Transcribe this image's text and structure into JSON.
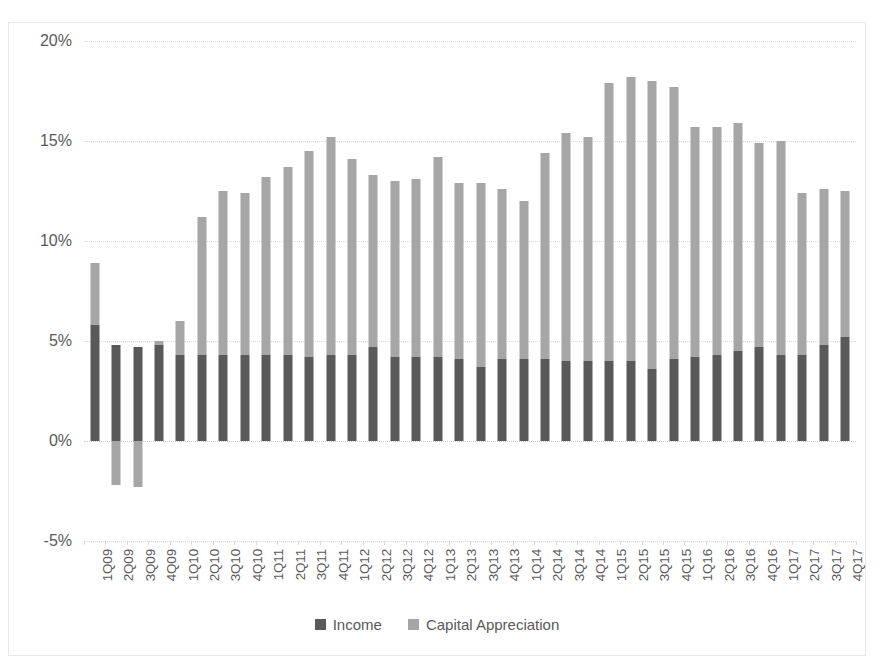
{
  "chart_data": {
    "type": "bar",
    "subtype": "stacked-column",
    "title": "",
    "xlabel": "",
    "ylabel": "",
    "ylim": [
      -5,
      20
    ],
    "yticks": [
      -5,
      0,
      5,
      10,
      15,
      20
    ],
    "ytick_labels": [
      "-5%",
      "0%",
      "5%",
      "10%",
      "15%",
      "20%"
    ],
    "grid": true,
    "legend_position": "bottom",
    "categories": [
      "1Q09",
      "2Q09",
      "3Q09",
      "4Q09",
      "1Q10",
      "2Q10",
      "3Q10",
      "4Q10",
      "1Q11",
      "2Q11",
      "3Q11",
      "4Q11",
      "1Q12",
      "2Q12",
      "3Q12",
      "4Q12",
      "1Q13",
      "2Q13",
      "3Q13",
      "4Q13",
      "1Q14",
      "2Q14",
      "3Q14",
      "4Q14",
      "1Q15",
      "2Q15",
      "3Q15",
      "4Q15",
      "1Q16",
      "2Q16",
      "3Q16",
      "4Q16",
      "1Q17",
      "2Q17",
      "3Q17",
      "4Q17"
    ],
    "series": [
      {
        "name": "Income",
        "color": "#595959",
        "values": [
          5.8,
          4.8,
          4.7,
          4.8,
          4.3,
          4.3,
          4.3,
          4.3,
          4.3,
          4.3,
          4.2,
          4.3,
          4.3,
          4.7,
          4.2,
          4.2,
          4.2,
          4.1,
          3.7,
          4.1,
          4.1,
          4.1,
          4.0,
          4.0,
          4.0,
          4.0,
          3.6,
          4.1,
          4.2,
          4.3,
          4.5,
          4.7,
          4.3,
          4.3,
          4.8,
          5.2
        ]
      },
      {
        "name": "Capital Appreciation",
        "color": "#a6a6a6",
        "values": [
          3.1,
          -2.2,
          -2.3,
          0.2,
          1.7,
          6.9,
          8.2,
          8.1,
          8.9,
          9.4,
          10.3,
          10.9,
          9.8,
          8.6,
          8.8,
          8.9,
          10.0,
          8.8,
          9.2,
          8.5,
          7.9,
          10.3,
          11.4,
          11.2,
          13.9,
          14.2,
          14.4,
          13.6,
          11.5,
          11.4,
          11.4,
          10.2,
          10.7,
          8.1,
          7.8,
          7.3
        ]
      }
    ],
    "totals": [
      8.9,
      4.8,
      4.7,
      5.0,
      6.0,
      11.2,
      12.5,
      12.4,
      13.2,
      13.7,
      14.5,
      15.2,
      14.1,
      13.3,
      13.0,
      13.1,
      14.2,
      12.9,
      12.9,
      12.6,
      12.0,
      14.4,
      15.4,
      15.2,
      17.9,
      18.2,
      18.0,
      17.7,
      15.7,
      15.7,
      15.9,
      14.9,
      15.0,
      12.4,
      12.6,
      12.5
    ]
  },
  "legend": {
    "items": [
      {
        "label": "Income"
      },
      {
        "label": "Capital Appreciation"
      }
    ]
  }
}
